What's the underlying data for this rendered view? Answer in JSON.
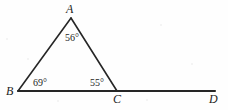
{
  "figure": {
    "type": "geometry-diagram",
    "stroke_color": "#262626",
    "background_color": "#fefefe",
    "vertices": [
      {
        "name": "A",
        "label": "A",
        "x": 71,
        "y": 18
      },
      {
        "name": "B",
        "label": "B",
        "x": 18,
        "y": 91
      },
      {
        "name": "C",
        "label": "C",
        "x": 117,
        "y": 91
      },
      {
        "name": "D",
        "label": "D",
        "x": 215,
        "y": 91
      }
    ],
    "segments": [
      {
        "name": "side-AB",
        "from": "B",
        "to": "A"
      },
      {
        "name": "side-AC",
        "from": "A",
        "to": "C"
      },
      {
        "name": "base-BD",
        "from": "B",
        "to": "D"
      }
    ],
    "angles": [
      {
        "name": "angle-at-A",
        "vertex": "A",
        "label": "56°"
      },
      {
        "name": "angle-at-B",
        "vertex": "B",
        "label": "69°"
      },
      {
        "name": "angle-at-C",
        "vertex": "C",
        "label": "55°"
      }
    ]
  }
}
